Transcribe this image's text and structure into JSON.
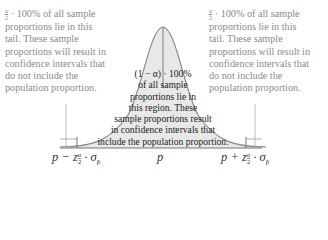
{
  "diagram": {
    "left_tail": {
      "fraction_num": "α",
      "fraction_den": "2",
      "lines": [
        " · 100% of all sample",
        "proportions lie in this",
        "tail. These sample",
        "proportions will result in",
        "confidence intervals that",
        "do not include the",
        "population proportion."
      ]
    },
    "right_tail": {
      "fraction_num": "α",
      "fraction_den": "2",
      "lines": [
        " · 100% of all sample",
        "proportions lie in this",
        "tail. These sample",
        "proportions will result in",
        "confidence intervals that",
        "do not include the",
        "population proportion."
      ]
    },
    "center_region": {
      "lines": [
        "(1 − α) · 100%",
        "of all sample",
        "proportions lie in",
        "this region. These",
        "sample proportions result",
        "in confidence intervals that",
        "include the population proportion."
      ]
    },
    "axis_labels": {
      "left": {
        "prefix": "p − z",
        "sub_num": "α",
        "sub_den": "2",
        "suffix": " · σ",
        "sigma_sub": "p̂"
      },
      "center": "p",
      "right": {
        "prefix": "p + z",
        "sub_num": "α",
        "sub_den": "2",
        "suffix": " · σ",
        "sigma_sub": "p̂"
      }
    },
    "colors": {
      "curve_fill": "#e8e8e8",
      "curve_stroke": "#8a8a8a",
      "tail_text": "#8a8a8a",
      "center_text": "#222222"
    }
  }
}
